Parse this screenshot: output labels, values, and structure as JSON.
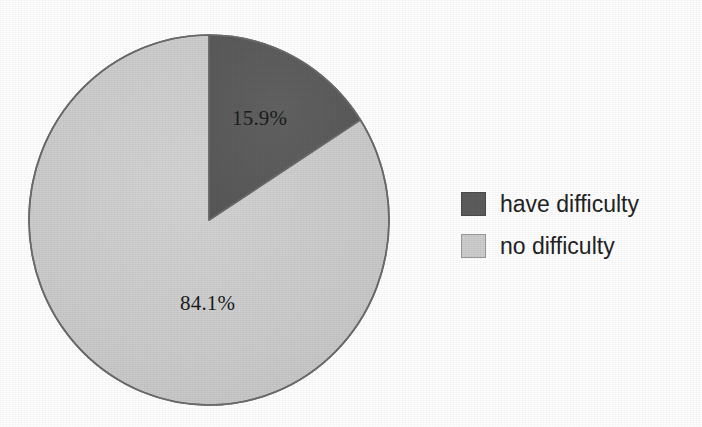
{
  "chart_data": {
    "type": "pie",
    "title": "",
    "subtitle": "",
    "xlabel": "",
    "ylabel": "",
    "grid": false,
    "legend_position": "right",
    "start_angle_deg": 0,
    "direction": "clockwise",
    "categories": [
      "have difficulty",
      "no difficulty"
    ],
    "values": [
      15.9,
      84.1
    ],
    "value_unit": "%",
    "colors": [
      "#5c5c5c",
      "#cdcdcd"
    ],
    "slices": [
      {
        "label": "have difficulty",
        "value": 15.9,
        "data_label": "15.9%",
        "color": "#5c5c5c",
        "sweep_deg": 57.24
      },
      {
        "label": "no difficulty",
        "value": 84.1,
        "data_label": "84.1%",
        "color": "#cdcdcd",
        "sweep_deg": 302.76
      }
    ]
  },
  "pie": {
    "labels": {
      "dark_slice": "15.9%",
      "light_slice": "84.1%"
    },
    "outline_color": "#6b6b6b"
  },
  "legend": {
    "items": [
      {
        "label": "have difficulty",
        "color": "#5c5c5c",
        "swatch": "legend-swatch-dark"
      },
      {
        "label": "no difficulty",
        "color": "#cdcdcd",
        "swatch": "legend-swatch-light"
      }
    ]
  }
}
